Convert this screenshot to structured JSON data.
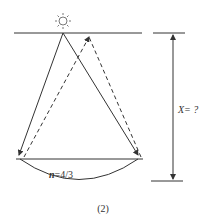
{
  "diagram": {
    "caption": "(2)",
    "lens_label_var": "n",
    "lens_label_value": "=4/3",
    "distance_label": "X= ?",
    "elements": [
      "light-source",
      "top-surface",
      "solid-rays",
      "dashed-rays",
      "lens-surface",
      "distance-arrow"
    ],
    "colors": {
      "line": "#333333",
      "background": "#ffffff"
    }
  }
}
